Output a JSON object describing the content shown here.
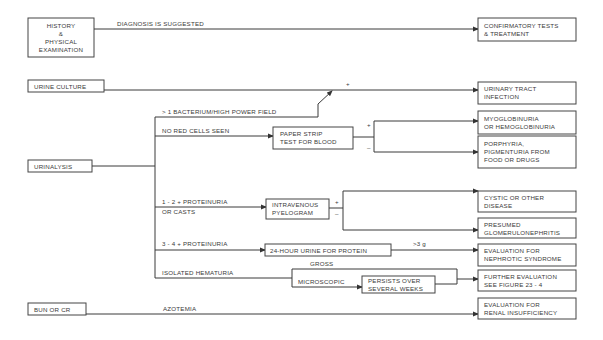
{
  "diagram": {
    "type": "flowchart",
    "start_nodes": {
      "history": [
        "HISTORY",
        "&",
        "PHYSICAL",
        "EXAMINATION"
      ],
      "urine_culture": "URINE CULTURE",
      "urinalysis": "URINALYSIS",
      "bun": "BUN OR CR"
    },
    "edge_labels": {
      "diagnosis_suggested": "DIAGNOSIS IS SUGGESTED",
      "culture_plus": "+",
      "bacterium": "> 1 BACTERIUM/HIGH POWER FIELD",
      "no_red_cells": "NO RED CELLS SEEN",
      "strip_plus": "+",
      "strip_minus": "–",
      "proteinuria_12": "1 - 2 + PROTEINURIA",
      "or_casts": "OR CASTS",
      "ivp_plus": "+",
      "ivp_minus": "–",
      "proteinuria_34": "3 - 4 + PROTEINURIA",
      "gt3g": ">3 g",
      "isolated_hematuria": "ISOLATED HEMATURIA",
      "gross": "GROSS",
      "microscopic": "MICROSCOPIC",
      "azotemia": "AZOTEMIA"
    },
    "intermediate_nodes": {
      "paper_strip": [
        "PAPER STRIP",
        "TEST FOR BLOOD"
      ],
      "ivp": [
        "INTRAVENOUS",
        "PYELOGRAM"
      ],
      "urine24": "24-HOUR URINE FOR PROTEIN",
      "persists": [
        "PERSISTS OVER",
        "SEVERAL WEEKS"
      ]
    },
    "outcome_nodes": {
      "confirmatory": [
        "CONFIRMATORY TESTS",
        "& TREATMENT"
      ],
      "uti": [
        "URINARY TRACT",
        "INFECTION"
      ],
      "myoglobinuria": [
        "MYOGLOBINURIA",
        "OR HEMOGLOBINURIA"
      ],
      "porphyria": [
        "PORPHYRIA,",
        "PIGMENTURIA  FROM",
        "FOOD OR DRUGS"
      ],
      "cystic": [
        "CYSTIC OR OTHER",
        "DISEASE"
      ],
      "glomerulonephritis": [
        "PRESUMED",
        "GLOMERULONEPHRITIS"
      ],
      "nephrotic": [
        "EVALUATION FOR",
        "NEPHROTIC SYNDROME"
      ],
      "further_eval": [
        "FURTHER EVALUATION",
        "SEE FIGURE 23 - 4"
      ],
      "renal": [
        "EVALUATION FOR",
        "RENAL INSUFFICIENCY"
      ]
    }
  }
}
